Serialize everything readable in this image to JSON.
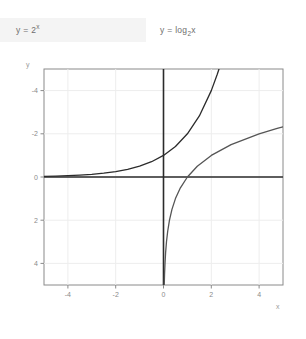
{
  "legend": {
    "exponential": "y = 2",
    "exponential_exponent": "x",
    "logarithm": "y = log",
    "logarithm_base": "2",
    "logarithm_arg": "x"
  },
  "axes": {
    "x_name": "x",
    "y_name": "y",
    "x_ticks": [
      "-4",
      "-2",
      "0",
      "2",
      "4"
    ],
    "y_ticks": [
      "4",
      "2",
      "0",
      "-2",
      "-4"
    ]
  },
  "chart_data": {
    "type": "line",
    "title": "",
    "xlabel": "x",
    "ylabel": "y",
    "xlim": [
      -5,
      5
    ],
    "ylim": [
      -5,
      5
    ],
    "grid": true,
    "legend_position": "top",
    "x_ticks": [
      -4,
      -2,
      0,
      2,
      4
    ],
    "y_ticks": [
      -4,
      -2,
      0,
      2,
      4
    ],
    "series": [
      {
        "name": "y = 2^x",
        "color": "#2b2b2b",
        "points": [
          [
            -5,
            0.031
          ],
          [
            -4.5,
            0.044
          ],
          [
            -4,
            0.063
          ],
          [
            -3.5,
            0.088
          ],
          [
            -3,
            0.125
          ],
          [
            -2.5,
            0.177
          ],
          [
            -2,
            0.25
          ],
          [
            -1.5,
            0.354
          ],
          [
            -1,
            0.5
          ],
          [
            -0.5,
            0.707
          ],
          [
            0,
            1
          ],
          [
            0.5,
            1.414
          ],
          [
            1,
            2
          ],
          [
            1.5,
            2.828
          ],
          [
            2,
            4
          ],
          [
            2.25,
            4.757
          ],
          [
            2.322,
            5
          ]
        ]
      },
      {
        "name": "y = log2 x",
        "color": "#555555",
        "points": [
          [
            0.031,
            -5
          ],
          [
            0.044,
            -4.5
          ],
          [
            0.063,
            -4
          ],
          [
            0.088,
            -3.5
          ],
          [
            0.125,
            -3
          ],
          [
            0.177,
            -2.5
          ],
          [
            0.25,
            -2
          ],
          [
            0.354,
            -1.5
          ],
          [
            0.5,
            -1
          ],
          [
            0.707,
            -0.5
          ],
          [
            1,
            0
          ],
          [
            1.414,
            0.5
          ],
          [
            2,
            1
          ],
          [
            2.828,
            1.5
          ],
          [
            4,
            2
          ],
          [
            4.757,
            2.25
          ],
          [
            5,
            2.322
          ]
        ]
      }
    ]
  }
}
